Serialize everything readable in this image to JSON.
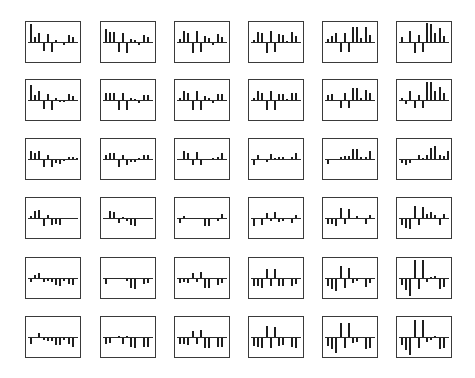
{
  "chart_data": {
    "type": "bar",
    "layout": "small-multiples grid",
    "rows": 6,
    "cols": 6,
    "bars_per_panel": 12,
    "title": "",
    "xlabel": "",
    "ylabel": "",
    "ylim": [
      -1,
      1
    ],
    "grid": false,
    "legend": null,
    "bar_color": "#1e1e1e",
    "frame_color": "#3a3a3a",
    "panels": [
      [
        {
          "values": [
            0.95,
            0.25,
            0.45,
            -0.4,
            0.4,
            -0.45,
            0.12,
            0,
            -0.08,
            0.35,
            0.25,
            0
          ]
        },
        {
          "values": [
            0.7,
            0.5,
            0.55,
            -0.45,
            0.45,
            -0.5,
            0.15,
            0.08,
            -0.1,
            0.35,
            0.25,
            0
          ]
        },
        {
          "values": [
            0.15,
            0.6,
            0.45,
            -0.5,
            0.6,
            -0.45,
            0.3,
            0.2,
            -0.1,
            0.4,
            0.25,
            0
          ]
        },
        {
          "values": [
            0.1,
            0.55,
            0.45,
            -0.5,
            0.6,
            -0.45,
            0.4,
            0.35,
            0.05,
            0.5,
            0.3,
            0
          ]
        },
        {
          "values": [
            0.15,
            0.3,
            0.45,
            -0.45,
            0.45,
            -0.45,
            0.8,
            0.8,
            0.2,
            0.8,
            0.35,
            0
          ]
        },
        {
          "values": [
            0.25,
            0,
            0.6,
            -0.5,
            0.35,
            -0.45,
            1.0,
            0.95,
            0.45,
            0.75,
            0.3,
            0
          ]
        }
      ],
      [
        {
          "values": [
            0.8,
            0.25,
            0.45,
            -0.4,
            0.3,
            -0.45,
            0.08,
            -0.05,
            -0.05,
            0.3,
            0.2,
            0
          ]
        },
        {
          "values": [
            0.35,
            0.35,
            0.35,
            -0.45,
            0.35,
            -0.45,
            0.1,
            0.05,
            -0.1,
            0.25,
            0.25,
            0
          ]
        },
        {
          "values": [
            0.1,
            0.45,
            0.35,
            -0.45,
            0.45,
            -0.45,
            0.2,
            0.1,
            -0.1,
            0.3,
            0.3,
            0
          ]
        },
        {
          "values": [
            0.1,
            0.45,
            0.35,
            -0.45,
            0.45,
            -0.45,
            0.3,
            0.3,
            0.05,
            0.35,
            0.35,
            0
          ]
        },
        {
          "values": [
            0.25,
            0.3,
            0,
            -0.35,
            0.35,
            -0.35,
            0.65,
            0.65,
            0.1,
            0.5,
            0.35,
            0
          ]
        },
        {
          "values": [
            0.1,
            -0.15,
            0.45,
            -0.35,
            0.25,
            -0.35,
            0.95,
            0.95,
            0.45,
            0.7,
            0.35,
            0
          ]
        }
      ],
      [
        {
          "values": [
            0.4,
            0.3,
            0.4,
            -0.35,
            0.2,
            -0.35,
            -0.15,
            -0.2,
            -0.05,
            0.1,
            0.1,
            0.05
          ]
        },
        {
          "values": [
            0.2,
            0.3,
            0.3,
            -0.35,
            0.2,
            -0.25,
            -0.1,
            -0.1,
            0.05,
            0.2,
            0.2,
            0
          ]
        },
        {
          "values": [
            0,
            0.4,
            0.3,
            -0.25,
            0.35,
            -0.25,
            0,
            0,
            0.05,
            0.1,
            0.3,
            0
          ]
        },
        {
          "values": [
            -0.25,
            0.2,
            0,
            -0.1,
            0.25,
            0.05,
            0.1,
            0.1,
            0,
            0.1,
            0.3,
            0
          ]
        },
        {
          "values": [
            -0.2,
            0,
            0,
            0.1,
            0.15,
            0.15,
            0.5,
            0.5,
            0.1,
            0.1,
            0.4,
            0
          ]
        },
        {
          "values": [
            -0.15,
            -0.25,
            -0.15,
            0,
            0.2,
            0.05,
            0.2,
            0.6,
            0.7,
            0.2,
            0.15,
            0.4
          ]
        }
      ],
      [
        {
          "values": [
            0.1,
            0.35,
            0.4,
            -0.35,
            0.15,
            -0.3,
            -0.25,
            -0.3,
            0,
            0,
            0,
            0
          ]
        },
        {
          "values": [
            0,
            0.35,
            0.3,
            -0.2,
            0.05,
            -0.1,
            -0.3,
            -0.35,
            0,
            0,
            0,
            0
          ]
        },
        {
          "values": [
            -0.2,
            0.1,
            0,
            0,
            0,
            0,
            -0.35,
            -0.35,
            0,
            -0.1,
            0.2,
            0
          ]
        },
        {
          "values": [
            -0.35,
            0,
            -0.3,
            0.25,
            -0.1,
            0.3,
            -0.15,
            -0.1,
            0,
            -0.2,
            0.15,
            0
          ]
        },
        {
          "values": [
            -0.25,
            -0.25,
            -0.35,
            0.5,
            -0.25,
            0.45,
            0,
            0.1,
            0,
            -0.25,
            0.15,
            0
          ]
        },
        {
          "values": [
            -0.3,
            -0.45,
            -0.5,
            0.65,
            -0.3,
            0.6,
            0.2,
            0.3,
            0.15,
            -0.3,
            0.2,
            0
          ]
        }
      ],
      [
        {
          "values": [
            -0.15,
            0.15,
            0.25,
            -0.15,
            -0.1,
            -0.15,
            -0.3,
            -0.35,
            -0.1,
            -0.25,
            -0.3,
            0
          ]
        },
        {
          "values": [
            -0.25,
            0,
            0,
            0,
            0,
            -0.1,
            -0.45,
            -0.5,
            0,
            -0.25,
            -0.2,
            0
          ]
        },
        {
          "values": [
            -0.2,
            -0.15,
            -0.2,
            0.25,
            -0.15,
            0.3,
            -0.45,
            -0.45,
            0,
            -0.3,
            -0.2,
            0
          ]
        },
        {
          "values": [
            -0.35,
            -0.35,
            -0.45,
            0.45,
            -0.35,
            0.45,
            -0.35,
            -0.35,
            0,
            -0.35,
            -0.25,
            0
          ]
        },
        {
          "values": [
            -0.35,
            -0.5,
            -0.65,
            0.65,
            -0.45,
            0.55,
            -0.2,
            -0.1,
            0,
            -0.4,
            -0.2,
            0
          ]
        },
        {
          "values": [
            -0.3,
            -0.6,
            -0.9,
            0.95,
            -0.5,
            0.95,
            -0.15,
            0.05,
            0.1,
            -0.55,
            -0.4,
            0
          ]
        }
      ],
      [
        {
          "values": [
            -0.3,
            0,
            0.2,
            -0.1,
            -0.15,
            -0.15,
            -0.35,
            -0.35,
            -0.1,
            -0.3,
            -0.45,
            0
          ]
        },
        {
          "values": [
            -0.3,
            -0.25,
            0,
            0.05,
            -0.3,
            0.05,
            -0.45,
            -0.5,
            0,
            -0.45,
            -0.45,
            0
          ]
        },
        {
          "values": [
            -0.3,
            -0.3,
            -0.35,
            0.3,
            -0.3,
            0.35,
            -0.5,
            -0.5,
            0,
            -0.45,
            -0.45,
            0
          ]
        },
        {
          "values": [
            -0.4,
            -0.45,
            -0.5,
            0.6,
            -0.5,
            0.55,
            -0.4,
            -0.35,
            0,
            -0.45,
            -0.5,
            0
          ]
        },
        {
          "values": [
            -0.4,
            -0.6,
            -0.8,
            0.75,
            -0.55,
            0.75,
            -0.25,
            -0.2,
            0,
            -0.6,
            -0.55,
            0
          ]
        },
        {
          "values": [
            -0.35,
            -0.65,
            -0.9,
            0.9,
            -0.5,
            0.9,
            -0.2,
            -0.1,
            0.05,
            -0.6,
            -0.55,
            0
          ]
        }
      ]
    ]
  },
  "layout": {
    "col_x": [
      25,
      100,
      174,
      248,
      322,
      396
    ],
    "row_y": [
      21,
      79,
      138,
      197,
      257,
      316
    ],
    "panel_w": 56,
    "panel_h": 42
  }
}
